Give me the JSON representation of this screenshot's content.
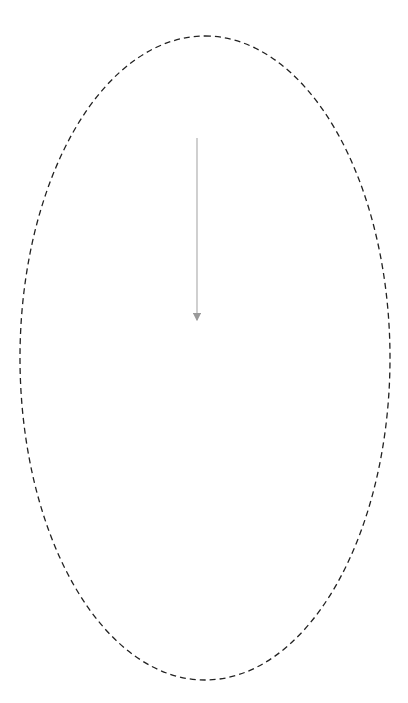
{
  "diagram": {
    "center_label": [
      "Sustainable",
      "Development",
      "of 6G"
    ],
    "education_boxes": [
      {
        "id": "top",
        "rows": [
          "Education system",
          "Knowledge creation",
          "Human Capital"
        ]
      },
      {
        "id": "right-top",
        "rows": [
          "Education system",
          "Knowledge creation",
          "Human Capital"
        ]
      },
      {
        "id": "right-bottom",
        "rows": [
          "Education system",
          "Knowledge creation",
          "Human Capital"
        ]
      },
      {
        "id": "bottom",
        "rows": [
          "Education system",
          "Knowledge creation",
          "Human Capital"
        ]
      }
    ],
    "political_box": {
      "rows": [
        "Political system",
        "Knowledge creation",
        "Political and legal system"
      ]
    },
    "cards": {
      "strengthening": {
        "title": "Strengthening relational power",
        "items": [
          "Poly-nodal world",
          "Public network finding",
          "AI rights",
          "Net neutrality",
          "Data ownership and regulation",
          "Wireless spectrum policies",
          "Privacy regulations"
        ]
      },
      "ageing": {
        "title": "Ageing and diversification of the population",
        "items": [
          "Conscious learning",
          "Human-machine interaction",
          "HMI",
          "Internet of Skills",
          "Mobile only next billion",
          "Quantum computing"
        ]
      },
      "redefinition": {
        "title": "Redefinition of the economy",
        "items": [
          "Open value configuration",
          "peer-to-peer economy models",
          "Edge and extreme edge intelligence",
          "Industry 5.0",
          "Private networks",
          "Over-the-top companies"
        ]
      },
      "technology": {
        "title": "Technology is deeply integrated into society and permeates our daily existence.",
        "items": [
          "Global interdependence",
          "Transmission",
          "Cybersecurity",
          "Tribalism, populism, skepticism"
        ]
      },
      "ecological": {
        "title": "Need for ecological reconstruction",
        "items": [
          "Sustainable materials",
          "Innovating to zero",
          "Circular economy",
          "Environmental awareness",
          "Smart goals"
        ]
      }
    },
    "labels": {
      "knowledge": "Knowledge",
      "know_how": "Know how",
      "innovation": "Innovation"
    },
    "caption": {
      "figure_no": "Figure 10.3",
      "text": "Sociotechnical model and sustainable development of 6G"
    },
    "colors": {
      "dark_band": "#5a5a5a",
      "box_bg": "#b9b9b9",
      "card_bg": "#ebebeb",
      "badge_bg": "#6b6b6b",
      "arrow": "#9a9a9a"
    }
  }
}
